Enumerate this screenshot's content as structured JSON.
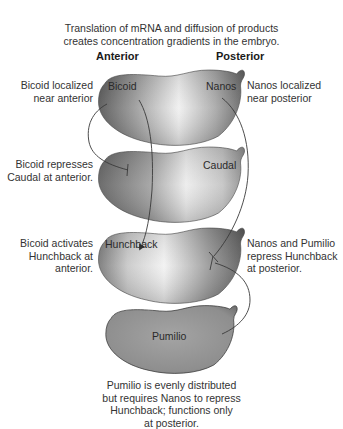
{
  "title": {
    "line1": "Translation of mRNA and diffusion of products",
    "line2": "creates concentration gradients in the embryo."
  },
  "axis": {
    "anterior": "Anterior",
    "posterior": "Posterior"
  },
  "embryos": [
    {
      "id": "bicoid-nanos",
      "labels": [
        "Bicoid",
        "Nanos"
      ]
    },
    {
      "id": "caudal",
      "labels": [
        "Caudal"
      ]
    },
    {
      "id": "hunchback",
      "labels": [
        "Hunchback"
      ]
    },
    {
      "id": "pumilio",
      "labels": [
        "Pumilio"
      ]
    }
  ],
  "annotations": {
    "bicoid_localized": {
      "line1": "Bicoid localized",
      "line2": "near anterior"
    },
    "nanos_localized": {
      "line1": "Nanos localized",
      "line2": "near posterior"
    },
    "bicoid_represses": {
      "line1": "Bicoid represses",
      "line2": "Caudal at anterior."
    },
    "bicoid_activates": {
      "line1": "Bicoid activates",
      "line2": "Hunchback at",
      "line3": "anterior."
    },
    "nanos_pumilio": {
      "line1": "Nanos and Pumilio",
      "line2": "repress Hunchback",
      "line3": "at posterior."
    },
    "pumilio_caption": {
      "line1": "Pumilio is evenly distributed",
      "line2": "but requires Nanos to repress",
      "line3": "Hunchback; functions only",
      "line4": "at posterior."
    }
  },
  "interactions": [
    {
      "from": "Bicoid",
      "to": "Caudal",
      "type": "repression"
    },
    {
      "from": "Bicoid",
      "to": "Hunchback",
      "type": "activation"
    },
    {
      "from": "Nanos",
      "to": "Hunchback",
      "type": "repression"
    },
    {
      "from": "Pumilio",
      "to": "Hunchback",
      "type": "repression"
    }
  ],
  "colors": {
    "embryo_dark": "#5a5a5a",
    "embryo_light": "#f2f2f2",
    "line": "#3a3a3a"
  }
}
